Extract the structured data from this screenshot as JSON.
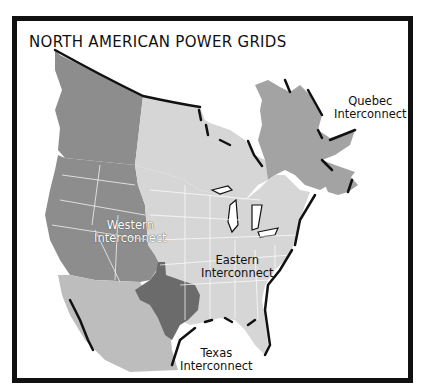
{
  "title": "NORTH AMERICAN POWER GRIDS",
  "regions": [
    {
      "id": "western",
      "line1": "Western",
      "line2": "Interconnect",
      "color": "#8d8d8d"
    },
    {
      "id": "eastern",
      "line1": "Eastern",
      "line2": "Interconnect",
      "color": "#d6d6d6"
    },
    {
      "id": "quebec",
      "line1": "Quebec",
      "line2": "Interconnect",
      "color": "#a3a3a3"
    },
    {
      "id": "texas",
      "line1": "Texas",
      "line2": "Interconnect",
      "color": "#6b6b6b"
    }
  ],
  "other_colors": {
    "mexico": "#bdbdbd",
    "frame": "#111111",
    "background": "#ffffff",
    "coast_shadow": "#111111"
  }
}
